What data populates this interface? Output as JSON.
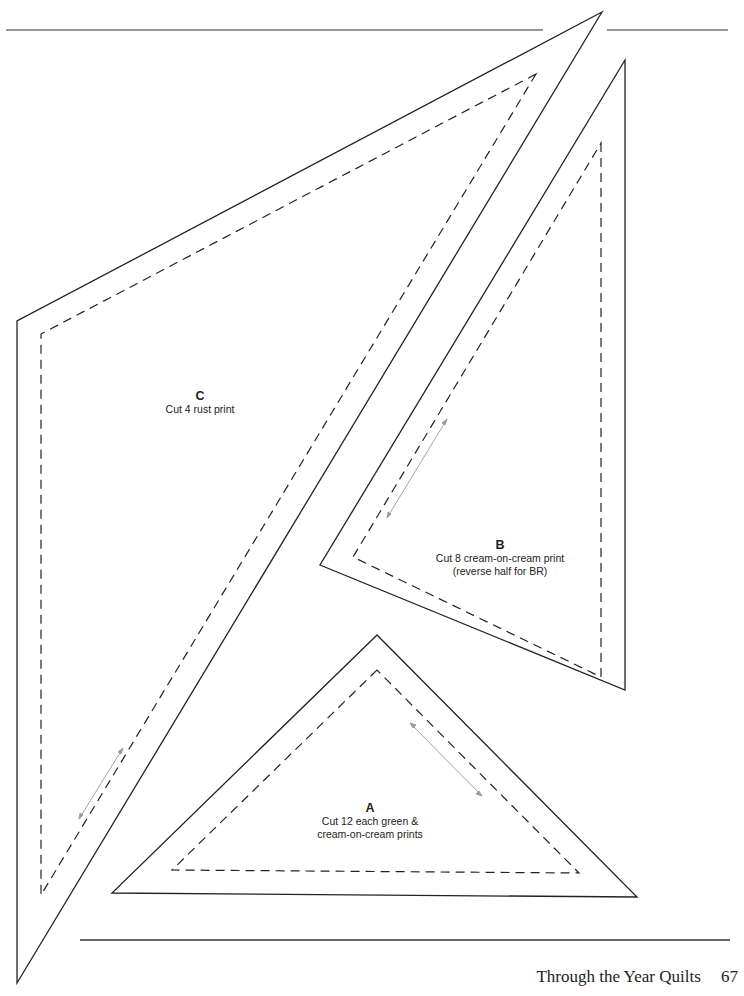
{
  "document": {
    "type": "quilt template page",
    "colors": {
      "cut_line": "#222222",
      "seam_line": "#222222",
      "grain_arrow": "#9a9a9a",
      "rule": "#333333"
    }
  },
  "pieces": [
    {
      "id": "C",
      "letter": "C",
      "lines": [
        "Cut 4 rust print"
      ]
    },
    {
      "id": "B",
      "letter": "B",
      "lines": [
        "Cut 8 cream-on-cream print",
        "(reverse half for BR)"
      ]
    },
    {
      "id": "A",
      "letter": "A",
      "lines": [
        "Cut 12 each green &",
        "cream-on-cream prints"
      ]
    }
  ],
  "footer": {
    "title": "Through the Year Quilts",
    "page_number": "67"
  }
}
